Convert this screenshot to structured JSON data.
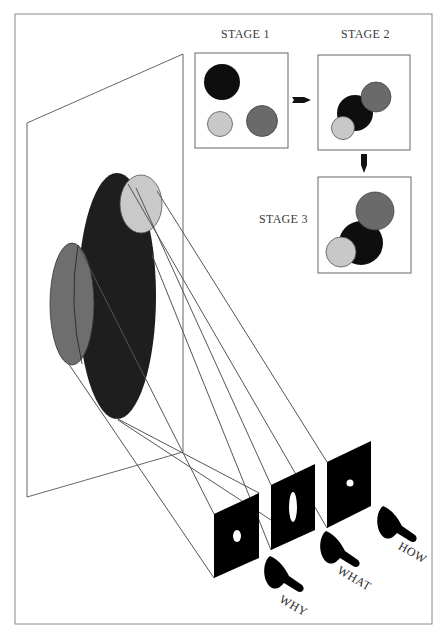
{
  "figure": {
    "colors": {
      "black": "#1c1c1c",
      "dark_gray": "#6e6e6e",
      "light_gray": "#c8c8c8",
      "outline": "#555555",
      "frame": "#808080"
    }
  },
  "stages": [
    {
      "label": "STAGE 1"
    },
    {
      "label": "STAGE 2"
    },
    {
      "label": "STAGE 3"
    }
  ],
  "projectors": [
    {
      "label": "WHY"
    },
    {
      "label": "WHAT"
    },
    {
      "label": "HOW"
    }
  ]
}
